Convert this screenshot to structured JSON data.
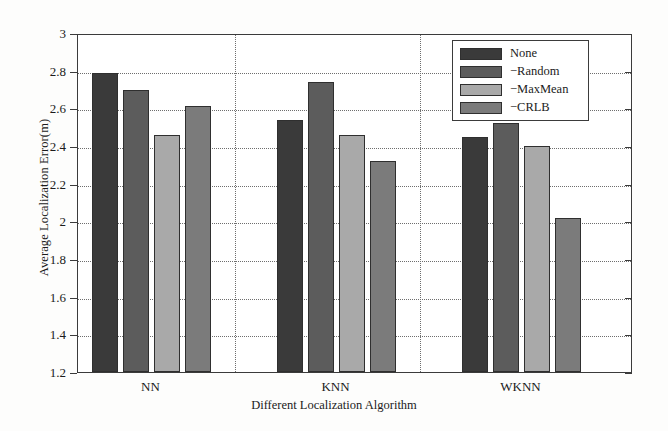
{
  "chart_data": {
    "type": "bar",
    "title": "",
    "subtitle": "",
    "xlabel": "Different Localization Algorithm",
    "ylabel": "Average Localization Error(m)",
    "categories": [
      "NN",
      "KNN",
      "WKNN"
    ],
    "series": [
      {
        "name": "None",
        "values": [
          2.79,
          2.54,
          2.45
        ],
        "color": "#3a3a3a"
      },
      {
        "name": "−Random",
        "values": [
          2.7,
          2.74,
          2.52
        ],
        "color": "#5c5c5c"
      },
      {
        "name": "−MaxMean",
        "values": [
          2.46,
          2.46,
          2.4
        ],
        "color": "#a9a9a9"
      },
      {
        "name": "−CRLB",
        "values": [
          2.61,
          2.32,
          2.02
        ],
        "color": "#7b7b7b"
      }
    ],
    "ylim": [
      1.2,
      3.0
    ],
    "yticks": [
      1.2,
      1.4,
      1.6,
      1.8,
      2.0,
      2.2,
      2.4,
      2.6,
      2.8,
      3.0
    ],
    "ytick_labels": [
      "1.2",
      "1.4",
      "1.6",
      "1.8",
      "2",
      "2.2",
      "2.4",
      "2.6",
      "2.8",
      "3"
    ],
    "grid": {
      "horizontal": true,
      "vertical": true,
      "style": "dotted"
    },
    "legend": {
      "position": "top-right",
      "entries": [
        "None",
        "−Random",
        "−MaxMean",
        "−CRLB"
      ]
    },
    "group_separators": [
      1,
      2
    ]
  }
}
